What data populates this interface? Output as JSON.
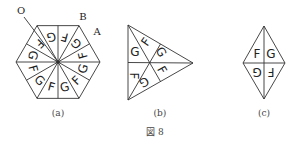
{
  "figure": {
    "title": "図 8",
    "panels": [
      {
        "id": "a",
        "caption": "(a)",
        "shape": "regular hexagon divided into 12 triangles",
        "point_labels": {
          "O": "O",
          "A": "A",
          "B": "B"
        },
        "sector_letters": [
          "G",
          "F",
          "G",
          "F",
          "G",
          "F",
          "G",
          "F",
          "G",
          "F",
          "G",
          "F"
        ]
      },
      {
        "id": "b",
        "caption": "(b)",
        "shape": "equilateral triangle divided into 6 triangles by medians",
        "sector_letters": [
          "F",
          "G",
          "F",
          "G",
          "F",
          "G"
        ]
      },
      {
        "id": "c",
        "caption": "(c)",
        "shape": "rhombus divided into 4 triangles by diagonals",
        "sector_letters": [
          "F",
          "G",
          "F",
          "G"
        ]
      }
    ]
  }
}
